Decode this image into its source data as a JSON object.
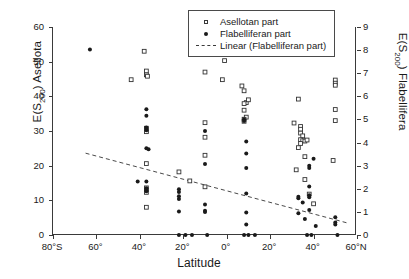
{
  "chart_data": {
    "type": "scatter",
    "title": "",
    "xlabel": "Latitude",
    "ylabel_left": "E(S200) Asellota",
    "ylabel_right": "E(S200) Flabellifera",
    "xlim": [
      -80,
      60
    ],
    "ylim_left": [
      0,
      60
    ],
    "ylim_right": [
      0,
      9
    ],
    "grid": false,
    "legend_position": "top-right",
    "xticks": [
      -80,
      -60,
      -40,
      -20,
      0,
      20,
      40,
      60
    ],
    "xticklabels": [
      "80°S",
      "60°",
      "40°",
      "20°",
      "0°",
      "20°",
      "40°",
      "60°N"
    ],
    "yticks_left": [
      0,
      10,
      20,
      30,
      40,
      50,
      60
    ],
    "yticklabels_left": [
      "0",
      "10",
      "20",
      "30",
      "40",
      "50",
      "60"
    ],
    "yticks_right": [
      0,
      1,
      2,
      3,
      4,
      5,
      6,
      7,
      8,
      9
    ],
    "yticklabels_right": [
      "0",
      "1",
      "2",
      "3",
      "4",
      "5",
      "6",
      "7",
      "8",
      "9"
    ],
    "legend": [
      {
        "label": "Asellotan part",
        "marker": "open-square"
      },
      {
        "label": "Flabelliferan part",
        "marker": "filled-circle"
      },
      {
        "label": "Linear (Flabelliferan part)",
        "marker": "dashed-line"
      }
    ],
    "series": [
      {
        "name": "Asellotan part",
        "marker": "open-square",
        "axis": "left",
        "points": [
          [
            -44,
            44.8
          ],
          [
            -38,
            53.0
          ],
          [
            -37,
            47.3
          ],
          [
            -37,
            46.2
          ],
          [
            -36.5,
            45.8
          ],
          [
            -37,
            30.8
          ],
          [
            -37,
            30.2
          ],
          [
            -37,
            29.8
          ],
          [
            -37,
            20.6
          ],
          [
            -37,
            13.6
          ],
          [
            -37,
            13.1
          ],
          [
            -37,
            12.3
          ],
          [
            -37,
            8.0
          ],
          [
            -22,
            18.2
          ],
          [
            -17,
            15.6
          ],
          [
            -10,
            47.0
          ],
          [
            -10,
            32.4
          ],
          [
            -10,
            28.2
          ],
          [
            -10,
            23.0
          ],
          [
            -10,
            13.9
          ],
          [
            -1,
            50.3
          ],
          [
            -2,
            44.8
          ],
          [
            7,
            43.0
          ],
          [
            8,
            41.6
          ],
          [
            9,
            38.2
          ],
          [
            8,
            37.9
          ],
          [
            8,
            36.0
          ],
          [
            9,
            34.0
          ],
          [
            8,
            33.4
          ],
          [
            8,
            32.8
          ],
          [
            10,
            39.0
          ],
          [
            31,
            32.3
          ],
          [
            33,
            39.2
          ],
          [
            34,
            31.3
          ],
          [
            34,
            30.5
          ],
          [
            34,
            29.4
          ],
          [
            35,
            28.6
          ],
          [
            34,
            27.5
          ],
          [
            35,
            27.2
          ],
          [
            36,
            27.1
          ],
          [
            34,
            26.4
          ],
          [
            33,
            25.2
          ],
          [
            37,
            27.4
          ],
          [
            36,
            22.6
          ],
          [
            32,
            18.8
          ],
          [
            36,
            16.0
          ],
          [
            38,
            11.8
          ],
          [
            40,
            9.0
          ],
          [
            50,
            44.7
          ],
          [
            50,
            43.8
          ],
          [
            50,
            43.2
          ],
          [
            50,
            36.2
          ],
          [
            50,
            33.0
          ],
          [
            49,
            21.5
          ]
        ]
      },
      {
        "name": "Flabelliferan part",
        "marker": "filled-circle",
        "axis": "left",
        "points": [
          [
            -63,
            53.5
          ],
          [
            -37,
            36.3
          ],
          [
            -37,
            34.4
          ],
          [
            -37,
            31.0
          ],
          [
            -37,
            30.2
          ],
          [
            -37,
            25.0
          ],
          [
            -36,
            24.7
          ],
          [
            -37,
            15.4
          ],
          [
            -41,
            15.4
          ],
          [
            -37,
            13.5
          ],
          [
            -37,
            13.0
          ],
          [
            -37,
            12.6
          ],
          [
            -22,
            13.2
          ],
          [
            -22,
            12.4
          ],
          [
            -22,
            11.2
          ],
          [
            -22,
            10.4
          ],
          [
            -22,
            6.8
          ],
          [
            -22,
            0
          ],
          [
            -19,
            0
          ],
          [
            -16,
            0
          ],
          [
            -10,
            30.0
          ],
          [
            -10,
            20.5
          ],
          [
            -10,
            8.8
          ],
          [
            -10,
            7.0
          ],
          [
            -10,
            6.6
          ],
          [
            -9,
            0
          ],
          [
            8,
            33.4
          ],
          [
            8,
            32.9
          ],
          [
            9,
            27.0
          ],
          [
            9,
            23.5
          ],
          [
            9,
            19.3
          ],
          [
            9,
            12.0
          ],
          [
            9,
            6.5
          ],
          [
            9,
            3.0
          ],
          [
            8,
            0
          ],
          [
            10,
            0
          ],
          [
            13,
            0
          ],
          [
            33,
            11.0
          ],
          [
            33,
            10.6
          ],
          [
            35,
            9.4
          ],
          [
            38,
            20.0
          ],
          [
            38,
            19.3
          ],
          [
            38,
            14.0
          ],
          [
            38,
            11.5
          ],
          [
            38,
            10.9
          ],
          [
            40,
            22.0
          ],
          [
            38,
            7.2
          ],
          [
            33,
            6.3
          ],
          [
            36,
            4.6
          ],
          [
            41,
            2.6
          ],
          [
            37,
            0
          ],
          [
            39,
            0
          ],
          [
            50,
            5.1
          ],
          [
            50,
            3.6
          ],
          [
            50,
            3.0
          ],
          [
            51,
            0
          ]
        ]
      }
    ],
    "trendline": {
      "name": "Linear (Flabelliferan part)",
      "style": "dashed",
      "axis": "left",
      "x_start": -65,
      "y_start": 23.6,
      "x_end": 56,
      "y_end": 3.4
    }
  }
}
